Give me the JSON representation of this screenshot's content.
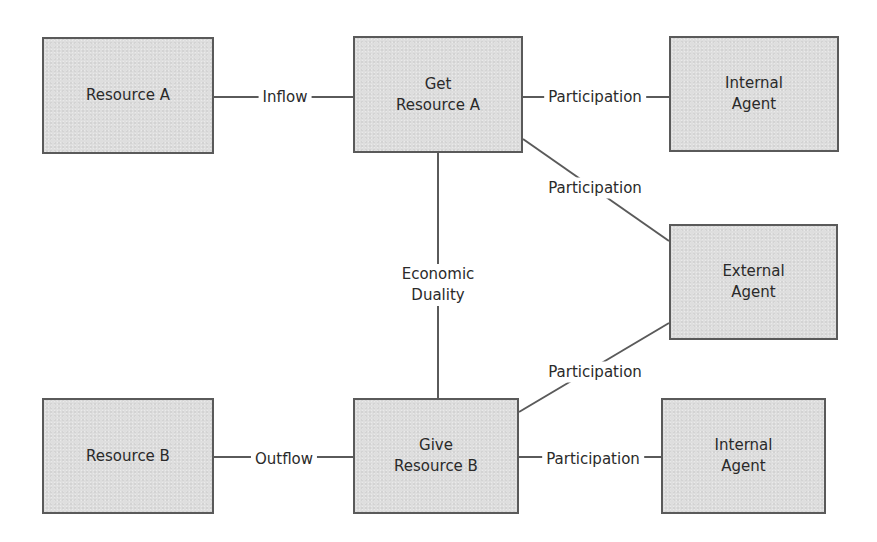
{
  "diagram": {
    "colors": {
      "node_fill": "#dedede",
      "node_border": "#5a5a5a",
      "edge": "#5a5a5a",
      "text": "#2a2a2a",
      "background": "#ffffff"
    },
    "nodes": [
      {
        "id": "resource_a",
        "label": "Resource A",
        "x": 42,
        "y": 37,
        "w": 172,
        "h": 117
      },
      {
        "id": "get_resource_a",
        "label": "Get\nResource A",
        "x": 353,
        "y": 36,
        "w": 170,
        "h": 117
      },
      {
        "id": "internal_agent_top",
        "label": "Internal\nAgent",
        "x": 669,
        "y": 36,
        "w": 170,
        "h": 116
      },
      {
        "id": "external_agent",
        "label": "External\nAgent",
        "x": 669,
        "y": 224,
        "w": 169,
        "h": 116
      },
      {
        "id": "resource_b",
        "label": "Resource B",
        "x": 42,
        "y": 398,
        "w": 172,
        "h": 116
      },
      {
        "id": "give_resource_b",
        "label": "Give\nResource B",
        "x": 353,
        "y": 398,
        "w": 166,
        "h": 116
      },
      {
        "id": "internal_agent_bottom",
        "label": "Internal\nAgent",
        "x": 661,
        "y": 398,
        "w": 165,
        "h": 116
      }
    ],
    "edges": [
      {
        "from": "resource_a",
        "to": "get_resource_a",
        "label": "Inflow",
        "x1": 214,
        "y1": 97,
        "x2": 353,
        "y2": 97,
        "lx": 285,
        "ly": 97
      },
      {
        "from": "get_resource_a",
        "to": "internal_agent_top",
        "label": "Participation",
        "x1": 523,
        "y1": 97,
        "x2": 669,
        "y2": 97,
        "lx": 595,
        "ly": 97
      },
      {
        "from": "get_resource_a",
        "to": "external_agent",
        "label": "Participation",
        "x1": 523,
        "y1": 139,
        "x2": 669,
        "y2": 241,
        "lx": 595,
        "ly": 188
      },
      {
        "from": "get_resource_a",
        "to": "give_resource_b",
        "label": "Economic\nDuality",
        "x1": 438,
        "y1": 153,
        "x2": 438,
        "y2": 398,
        "lx": 438,
        "ly": 285
      },
      {
        "from": "give_resource_b",
        "to": "external_agent",
        "label": "Participation",
        "x1": 519,
        "y1": 412,
        "x2": 669,
        "y2": 323,
        "lx": 595,
        "ly": 372
      },
      {
        "from": "resource_b",
        "to": "give_resource_b",
        "label": "Outflow",
        "x1": 214,
        "y1": 457,
        "x2": 353,
        "y2": 457,
        "lx": 284,
        "ly": 459
      },
      {
        "from": "give_resource_b",
        "to": "internal_agent_bottom",
        "label": "Participation",
        "x1": 519,
        "y1": 457,
        "x2": 661,
        "y2": 457,
        "lx": 593,
        "ly": 459
      }
    ]
  }
}
